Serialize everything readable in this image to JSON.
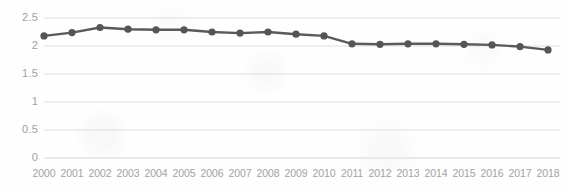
{
  "chart_data": {
    "type": "line",
    "title": "",
    "subtitle": "",
    "xlabel": "",
    "ylabel": "",
    "categories": [
      "2000",
      "2001",
      "2002",
      "2003",
      "2004",
      "2005",
      "2006",
      "2007",
      "2008",
      "2009",
      "2010",
      "2011",
      "2012",
      "2013",
      "2014",
      "2015",
      "2016",
      "2017",
      "2018"
    ],
    "values": [
      2.18,
      2.24,
      2.33,
      2.3,
      2.29,
      2.29,
      2.25,
      2.23,
      2.25,
      2.21,
      2.18,
      2.04,
      2.03,
      2.04,
      2.04,
      2.03,
      2.02,
      1.99,
      1.93
    ],
    "series": [
      {
        "name": "series-1",
        "values": [
          2.18,
          2.24,
          2.33,
          2.3,
          2.29,
          2.29,
          2.25,
          2.23,
          2.25,
          2.21,
          2.18,
          2.04,
          2.03,
          2.04,
          2.04,
          2.03,
          2.02,
          1.99,
          1.93
        ]
      }
    ],
    "ylim": [
      0,
      2.5
    ],
    "yticks": [
      "0",
      "0.5",
      "1",
      "1.5",
      "2",
      "2.5"
    ],
    "ytick_values": [
      0,
      0.5,
      1,
      1.5,
      2,
      2.5
    ],
    "grid": true,
    "grid_axis": "y",
    "legend": false,
    "legend_position": "none",
    "annotations": [],
    "colors": {
      "line": "#5a5a5a",
      "marker": "#555555",
      "grid": "#dedede",
      "tick_text": "#a0a0a0",
      "background": "#fefefe"
    }
  }
}
